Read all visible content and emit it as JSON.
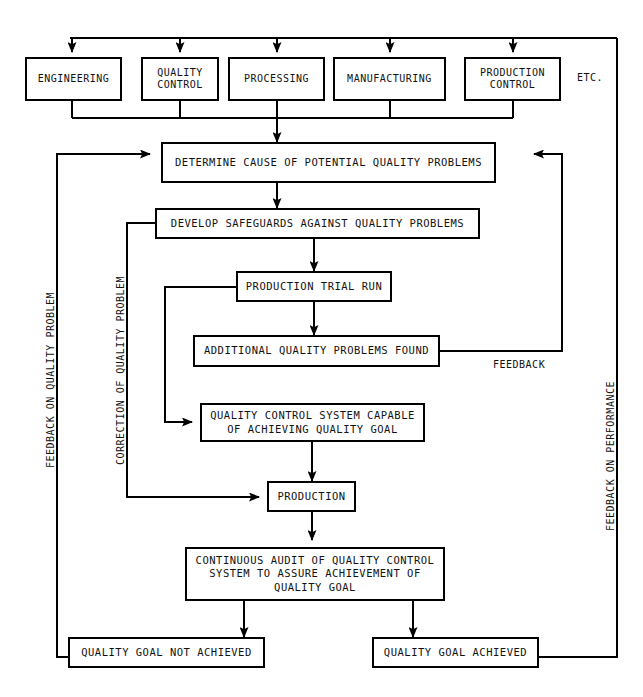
{
  "diagram": {
    "line_color": "#000000",
    "background_color": "#ffffff",
    "text_color": "#111111"
  },
  "top_row": {
    "boxes": [
      {
        "label": "ENGINEERING"
      },
      {
        "label": "QUALITY\nCONTROL"
      },
      {
        "label": "PROCESSING"
      },
      {
        "label": "MANUFACTURING"
      },
      {
        "label": "PRODUCTION\nCONTROL"
      }
    ],
    "etc_label": "ETC."
  },
  "process": {
    "determine_cause": "DETERMINE CAUSE OF POTENTIAL QUALITY PROBLEMS",
    "develop_safeguards": "DEVELOP SAFEGUARDS AGAINST QUALITY PROBLEMS",
    "production_trial_run": "PRODUCTION TRIAL RUN",
    "additional_problems": "ADDITIONAL QUALITY PROBLEMS FOUND",
    "qc_system_capable": "QUALITY CONTROL SYSTEM CAPABLE\nOF ACHIEVING QUALITY GOAL",
    "production": "PRODUCTION",
    "continuous_audit": "CONTINUOUS AUDIT OF QUALITY CONTROL\nSYSTEM TO ASSURE ACHIEVEMENT OF\nQUALITY GOAL",
    "goal_not_achieved": "QUALITY GOAL NOT ACHIEVED",
    "goal_achieved": "QUALITY GOAL ACHIEVED"
  },
  "annotations": {
    "feedback": "FEEDBACK",
    "feedback_on_quality_problem": "FEEDBACK ON QUALITY PROBLEM",
    "correction_of_quality_problem": "CORRECTION OF QUALITY PROBLEM",
    "feedback_on_performance": "FEEDBACK ON PERFORMANCE"
  }
}
